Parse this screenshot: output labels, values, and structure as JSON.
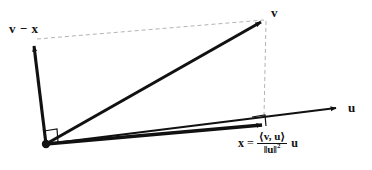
{
  "diagram": {
    "type": "vector-projection",
    "background_color": "#ffffff",
    "stroke_color": "#111111",
    "dashed_color": "#b0b0b0",
    "labels": {
      "v_minus_x": "v − x",
      "v": "v",
      "u": "u",
      "x_lhs": "x",
      "equals": "=",
      "numerator": "⟨v, u⟩",
      "denominator": "‖u‖",
      "denominator_exponent": "2",
      "trailing_factor": "u"
    },
    "geometry": {
      "origin": {
        "x": 46,
        "y": 144
      },
      "v_tip": {
        "x": 266,
        "y": 18
      },
      "v_minus_x_tip": {
        "x": 33,
        "y": 42
      },
      "projection_point": {
        "x": 268,
        "y": 124
      },
      "u_axis_tip": {
        "x": 342,
        "y": 107
      },
      "u_axis_start": {
        "x": 46,
        "y": 144
      }
    },
    "right_angle_markers": [
      {
        "name": "origin-right-angle",
        "x": 46,
        "y": 144
      },
      {
        "name": "projection-right-angle",
        "x": 268,
        "y": 124
      }
    ],
    "dashed_segments": [
      {
        "name": "v-minus-x-to-v",
        "from": {
          "x": 37,
          "y": 39
        },
        "to": {
          "x": 264,
          "y": 20
        }
      },
      {
        "name": "v-to-projection",
        "from": {
          "x": 266,
          "y": 20
        },
        "to": {
          "x": 264,
          "y": 117
        }
      }
    ]
  }
}
